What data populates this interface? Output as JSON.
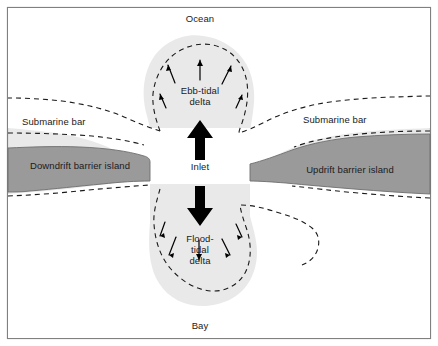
{
  "figure": {
    "background_color": "#e9e9e9",
    "border_color": "#808080",
    "water_color": "#ffffff",
    "island_color": "#9a9a9a",
    "island_edge_color": "#6e6e6e",
    "dashed_color": "#1a1a1a",
    "arrow_color": "#000000",
    "labels": {
      "ocean": "Ocean",
      "bay": "Bay",
      "ebb_tidal_delta": "Ebb-tidal\ndelta",
      "flood_tidal_delta": "Flood-\ntidal\ndelta",
      "inlet": "Inlet",
      "submarine_bar_left": "Submarine bar",
      "submarine_bar_right": "Submarine bar",
      "downdrift_island": "Downdrift barrier island",
      "updrift_island": "Updrift barrier island"
    }
  }
}
